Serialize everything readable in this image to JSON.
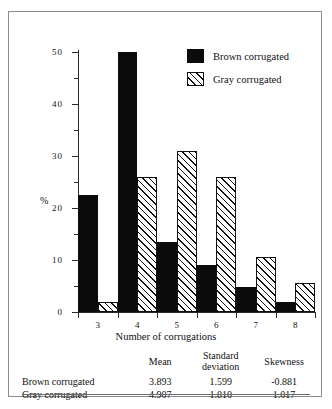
{
  "chart_data": {
    "type": "bar",
    "title": "",
    "xlabel": "Number of corrugations",
    "ylabel": "%",
    "categories": [
      "3",
      "4",
      "5",
      "6",
      "7",
      "8"
    ],
    "ylim": [
      0,
      50
    ],
    "yticks": [
      0,
      10,
      20,
      30,
      40,
      50
    ],
    "yticks_minor": [
      5,
      15,
      25,
      35,
      45
    ],
    "grid": false,
    "legend_position": "top-right",
    "series": [
      {
        "name": "Brown corrugated",
        "style": "solid-black",
        "color": "#0b0b0b",
        "values": [
          22.5,
          50.0,
          13.5,
          9.0,
          4.8,
          2.0
        ]
      },
      {
        "name": "Gray corrugated",
        "style": "diagonal-hatch",
        "color": "#ffffff",
        "values": [
          2.0,
          26.0,
          31.0,
          26.0,
          10.5,
          5.5
        ]
      }
    ]
  },
  "legend": {
    "items": [
      {
        "label": "Brown corrugated",
        "swatch": "solid-black"
      },
      {
        "label": "Gray corrugated",
        "swatch": "diagonal-hatch"
      }
    ]
  },
  "axes": {
    "y_label": "%",
    "y_tick_labels": [
      "0",
      "10",
      "20",
      "30",
      "40",
      "50"
    ],
    "x_tick_labels": [
      "3",
      "4",
      "5",
      "6",
      "7",
      "8"
    ],
    "x_title": "Number of corrugations"
  },
  "stats_table": {
    "headers": [
      "",
      "Mean",
      "Standard deviation",
      "Skewness"
    ],
    "rows": [
      {
        "name": "Brown corrugated",
        "mean": "3.893",
        "sd": "1.599",
        "skewness": "-0.881"
      },
      {
        "name": "Gray corrugated",
        "mean": "4.907",
        "sd": "1.810",
        "skewness": "1.017"
      }
    ]
  }
}
